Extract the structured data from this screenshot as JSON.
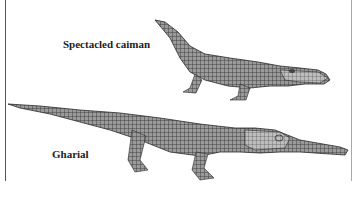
{
  "figure": {
    "caption_partial": "· · ·",
    "labels": {
      "caiman": "Spectacled caiman",
      "gharial": "Gharial"
    },
    "colors": {
      "background": "#ffffff",
      "ink": "#3a3a3a",
      "shade": "#8a8a8a",
      "frame_left": "#555555",
      "frame_right": "#aaaaaa"
    }
  }
}
